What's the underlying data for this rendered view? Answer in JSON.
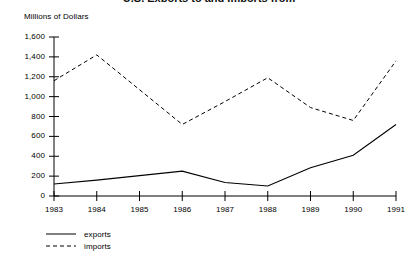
{
  "chart_data": {
    "type": "line",
    "title": "U.S. Exports to and Imports from",
    "subtitle": "",
    "xlabel": "",
    "ylabel": "Millions of Dollars",
    "x": [
      1983,
      1984,
      1985,
      1986,
      1987,
      1988,
      1989,
      1990,
      1991
    ],
    "categories": [
      "1983",
      "1984",
      "1985",
      "1986",
      "1987",
      "1988",
      "1989",
      "1990",
      "1991"
    ],
    "ylim": [
      0,
      1600
    ],
    "ytick_values": [
      0,
      200,
      400,
      600,
      800,
      1000,
      1200,
      1400,
      1600
    ],
    "ytick_labels": [
      "0",
      "200",
      "400",
      "600",
      "800",
      "1,000",
      "1,200",
      "1,400",
      "1,600"
    ],
    "grid": false,
    "legend_position": "bottom-left",
    "series": [
      {
        "name": "exports",
        "style": "solid",
        "color": "#000000",
        "values": [
          120,
          160,
          205,
          250,
          135,
          100,
          285,
          410,
          720
        ]
      },
      {
        "name": "imports",
        "style": "dashed",
        "color": "#000000",
        "values": [
          1160,
          1420,
          1070,
          720,
          950,
          1190,
          890,
          760,
          1360
        ]
      }
    ]
  },
  "axis": {
    "y_label": "Millions of Dollars"
  },
  "legend": {
    "items": [
      {
        "label": "exports",
        "style": "solid"
      },
      {
        "label": "imports",
        "style": "dashed"
      }
    ]
  }
}
